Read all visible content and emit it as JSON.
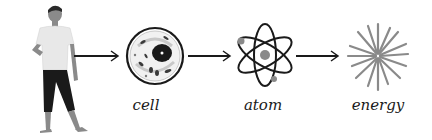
{
  "diagram": {
    "stages": [
      {
        "id": "person",
        "label": ""
      },
      {
        "id": "cell",
        "label": "cell"
      },
      {
        "id": "atom",
        "label": "atom"
      },
      {
        "id": "energy",
        "label": "energy"
      }
    ],
    "arrows": 3,
    "colors": {
      "ink": "#1a1a1a",
      "gray": "#8a8a8a",
      "light_gray": "#d9d9d9",
      "skin": "#9a9a9a",
      "background": "#ffffff"
    }
  }
}
